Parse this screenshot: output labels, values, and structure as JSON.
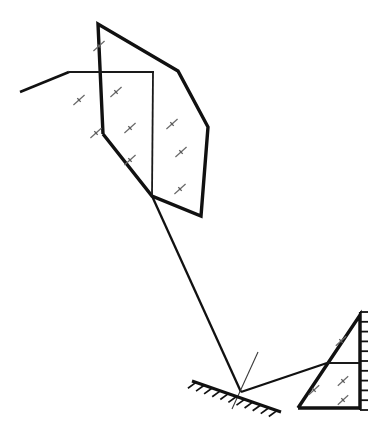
{
  "canvas": {
    "width": 380,
    "height": 442,
    "background": "#ffffff"
  },
  "colors": {
    "outline": "#111111",
    "inner_line": "#1a1a1a",
    "ray": "#111111",
    "hatch": "#6a6a6a",
    "normal": "#3a3a3a",
    "background": "#ffffff"
  },
  "object_shape": {
    "name": "object-polygon",
    "outline_points": "103,134 98,24 178,71 208,127 201,216 152,196 103,134",
    "inner_lines": [
      {
        "name": "inner-line-horizontal",
        "x1": 69,
        "y1": 72,
        "x2": 154,
        "y2": 72
      },
      {
        "name": "inner-line-vertical",
        "x1": 153,
        "y1": 72,
        "x2": 152,
        "y2": 196
      }
    ],
    "tail": {
      "name": "object-tail",
      "x1": 69,
      "y1": 72,
      "x2": 20,
      "y2": 92
    },
    "hatch_marks": [
      {
        "x": 99,
        "y": 46,
        "angle": -42,
        "len": 15
      },
      {
        "x": 79,
        "y": 100,
        "angle": -42,
        "len": 15
      },
      {
        "x": 116,
        "y": 92,
        "angle": -42,
        "len": 15
      },
      {
        "x": 96,
        "y": 133,
        "angle": -42,
        "len": 15
      },
      {
        "x": 130,
        "y": 128,
        "angle": -42,
        "len": 15
      },
      {
        "x": 130,
        "y": 160,
        "angle": -42,
        "len": 15
      },
      {
        "x": 172,
        "y": 124,
        "angle": -42,
        "len": 15
      },
      {
        "x": 181,
        "y": 152,
        "angle": -42,
        "len": 15
      },
      {
        "x": 180,
        "y": 189,
        "angle": -42,
        "len": 15
      }
    ]
  },
  "image_shape": {
    "name": "image-triangle",
    "outline_points": "298,408 360,315 360,408 298,408",
    "inner_lines": [
      {
        "name": "image-inner-horizontal",
        "x1": 327,
        "y1": 363,
        "x2": 360,
        "y2": 363
      }
    ],
    "hatch_marks": [
      {
        "x": 341,
        "y": 341,
        "angle": -42,
        "len": 14
      },
      {
        "x": 314,
        "y": 390,
        "angle": -42,
        "len": 14
      },
      {
        "x": 343,
        "y": 381,
        "angle": -42,
        "len": 14
      },
      {
        "x": 343,
        "y": 400,
        "angle": -42,
        "len": 14
      }
    ]
  },
  "mirror": {
    "name": "mirror",
    "line": {
      "x1": 192,
      "y1": 381,
      "x2": 281,
      "y2": 412
    },
    "tick_count": 11,
    "tick_length": 10,
    "tick_angle": -55
  },
  "rays": [
    {
      "name": "incident-ray",
      "x1": 152,
      "y1": 196,
      "x2": 241,
      "y2": 392
    },
    {
      "name": "reflected-ray",
      "x1": 241,
      "y1": 392,
      "x2": 327,
      "y2": 363
    }
  ],
  "normal": {
    "name": "normal-line",
    "x1": 258,
    "y1": 352,
    "x2": 232,
    "y2": 409
  },
  "scale": {
    "name": "measurement-scale",
    "axis": {
      "x1": 360,
      "y1": 312,
      "x2": 360,
      "y2": 410
    },
    "tick_count": 11,
    "tick_length": 8,
    "side": "right"
  },
  "labels": {
    "object": "object",
    "image": "image",
    "mirror": "mirror",
    "incident_ray": "incident ray",
    "reflected_ray": "reflected ray",
    "normal": "normal"
  }
}
